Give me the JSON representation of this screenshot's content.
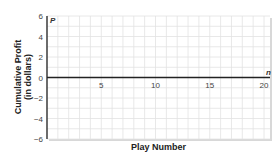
{
  "chart_data": {
    "type": "line",
    "title": "",
    "xlabel": "Play Number",
    "ylabel_line1": "Cumulative Profit",
    "ylabel_line2": "(in dollars)",
    "x_axis_var": "n",
    "y_axis_var": "P",
    "xlim": [
      0,
      20
    ],
    "ylim": [
      -6,
      6
    ],
    "x_ticks": [
      5,
      10,
      15,
      20
    ],
    "y_ticks": [
      -6,
      -4,
      -2,
      0,
      2,
      4,
      6
    ],
    "grid": true,
    "grid_step_x": 1,
    "grid_step_y": 1,
    "series": []
  }
}
